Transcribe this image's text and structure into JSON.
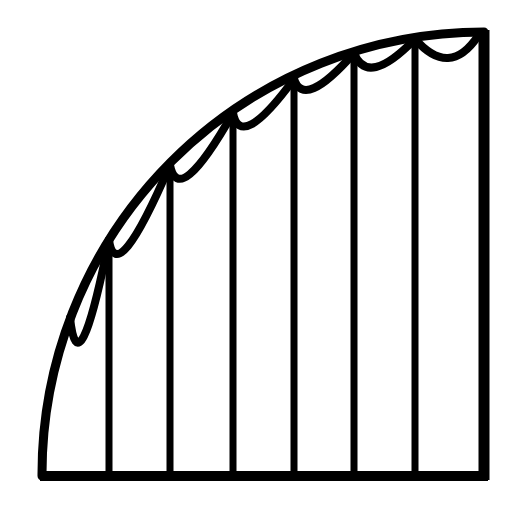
{
  "figure": {
    "colors": {
      "stroke": "#000000",
      "background": "#ffffff"
    },
    "geometry": {
      "baseline_y": 476,
      "left_x": 42,
      "right_x": 484,
      "top_y": 32,
      "arc_center": [
        484,
        476
      ],
      "arc_radius": 442
    },
    "strip_lines_x": [
      109,
      170,
      233,
      294,
      354,
      415
    ],
    "scallops": [
      {
        "from": [
          70,
          318
        ],
        "to": [
          109,
          240
        ],
        "sag": [
          84,
          336
        ]
      },
      {
        "from": [
          109,
          240
        ],
        "to": [
          170,
          165
        ],
        "sag": [
          128,
          246
        ]
      },
      {
        "from": [
          170,
          165
        ],
        "to": [
          233,
          113
        ],
        "sag": [
          190,
          174
        ]
      },
      {
        "from": [
          233,
          113
        ],
        "to": [
          294,
          79
        ],
        "sag": [
          252,
          124
        ]
      },
      {
        "from": [
          294,
          79
        ],
        "to": [
          354,
          53
        ],
        "sag": [
          314,
          88
        ]
      },
      {
        "from": [
          354,
          53
        ],
        "to": [
          415,
          39
        ],
        "sag": [
          376,
          67
        ]
      },
      {
        "from": [
          415,
          39
        ],
        "to": [
          478,
          36
        ],
        "sag": [
          448,
          58
        ]
      }
    ]
  }
}
